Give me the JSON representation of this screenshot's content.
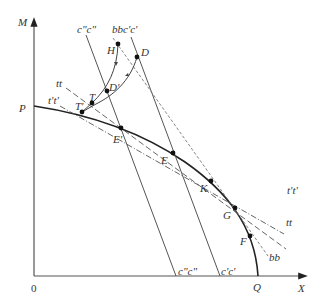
{
  "diagram": {
    "axes": {
      "y_label": "M",
      "x_label": "X",
      "origin_label": "0"
    },
    "curve": {
      "start_label": "P",
      "end_label": "Q"
    },
    "points": [
      {
        "id": "H",
        "label": "H"
      },
      {
        "id": "D",
        "label": "D"
      },
      {
        "id": "D_prime",
        "label": "D'"
      },
      {
        "id": "T",
        "label": "T"
      },
      {
        "id": "T_prime",
        "label": "T'"
      },
      {
        "id": "E_prime",
        "label": "E'"
      },
      {
        "id": "E",
        "label": "E"
      },
      {
        "id": "K",
        "label": "K"
      },
      {
        "id": "G",
        "label": "G"
      },
      {
        "id": "F",
        "label": "F"
      }
    ],
    "lines": {
      "cc2": "c\"c\"",
      "cc1": "c'c'",
      "bb": "bb",
      "tt": "tt",
      "tt1": "t't'"
    }
  }
}
